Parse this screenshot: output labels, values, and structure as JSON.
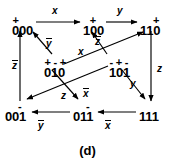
{
  "figure": {
    "caption": "(d)",
    "type": "state-transition-diagram",
    "stroke_color": "#000000",
    "background_color": "#ffffff"
  },
  "nodes": [
    {
      "id": "n000",
      "label": "000",
      "marks": "+  ",
      "x": 12,
      "y": 18
    },
    {
      "id": "n100",
      "label": "100",
      "marks": " + ",
      "x": 83,
      "y": 18
    },
    {
      "id": "n110",
      "label": "110",
      "marks": "  +",
      "x": 140,
      "y": 18
    },
    {
      "id": "n010",
      "label": "010",
      "marks": "+-+",
      "x": 44,
      "y": 60
    },
    {
      "id": "n101",
      "label": "101",
      "marks": "-+-",
      "x": 109,
      "y": 60
    },
    {
      "id": "n001",
      "label": "001",
      "marks": "  -",
      "x": 5,
      "y": 104
    },
    {
      "id": "n011",
      "label": "011",
      "marks": "  -",
      "x": 73,
      "y": 104
    },
    {
      "id": "n111",
      "label": "111",
      "marks": "   ",
      "x": 139,
      "y": 104
    }
  ],
  "edges": [
    {
      "id": "e-000-100",
      "from": "000",
      "to": "100",
      "label": "x",
      "bar": false,
      "lx": 52,
      "ly": 6
    },
    {
      "id": "e-100-110",
      "from": "100",
      "to": "110",
      "label": "y",
      "bar": false,
      "lx": 117,
      "ly": 6
    },
    {
      "id": "e-001-000",
      "from": "001",
      "to": "000",
      "label": "z",
      "bar": true,
      "lx": 12,
      "ly": 60
    },
    {
      "id": "e-110-111",
      "from": "110",
      "to": "111",
      "label": "z",
      "bar": false,
      "lx": 157,
      "ly": 64
    },
    {
      "id": "e-011-001",
      "from": "011",
      "to": "001",
      "label": "y",
      "bar": true,
      "lx": 38,
      "ly": 120
    },
    {
      "id": "e-111-011",
      "from": "111",
      "to": "011",
      "label": "x",
      "bar": true,
      "lx": 105,
      "ly": 120
    },
    {
      "id": "e-010-000",
      "from": "010",
      "to": "000",
      "label": "y",
      "bar": true,
      "lx": 46,
      "ly": 38
    },
    {
      "id": "e-010-110",
      "from": "010",
      "to": "110",
      "label": "x",
      "bar": false,
      "lx": 78,
      "ly": 47
    },
    {
      "id": "e-101-100",
      "from": "101",
      "to": "100",
      "label": "z",
      "bar": true,
      "lx": 95,
      "ly": 36
    },
    {
      "id": "e-101-001",
      "from": "101",
      "to": "001",
      "label": "x",
      "bar": true,
      "lx": 83,
      "ly": 88
    },
    {
      "id": "e-010-011",
      "from": "010",
      "to": "011",
      "label": "z",
      "bar": false,
      "lx": 61,
      "ly": 91
    },
    {
      "id": "e-101-111",
      "from": "101",
      "to": "111",
      "label": "y",
      "bar": false,
      "lx": 130,
      "ly": 79
    }
  ]
}
